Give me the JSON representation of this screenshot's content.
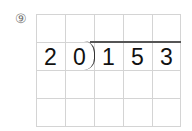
{
  "problem": {
    "label": "⑨",
    "divisor": [
      "2",
      "0"
    ],
    "dividend": [
      "1",
      "5",
      "3"
    ],
    "digits": [
      "2",
      "0",
      "1",
      "5",
      "3"
    ],
    "grid": {
      "columns": 5,
      "rows": 4,
      "digit_row": 2
    }
  },
  "colors": {
    "grid_line": "#d4d4d4",
    "digit": "#111111",
    "division_line": "#555555",
    "label": "#777777"
  }
}
